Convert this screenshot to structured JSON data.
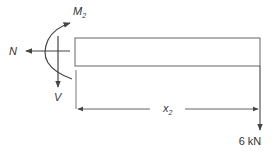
{
  "diagram": {
    "type": "free-body-diagram",
    "labels": {
      "moment": "M",
      "moment_sub": "2",
      "normal": "N",
      "shear": "V",
      "length": "x",
      "length_sub": "2",
      "load": "6 kN"
    },
    "colors": {
      "stroke": "#555555",
      "text": "#333333",
      "background": "#ffffff"
    }
  }
}
